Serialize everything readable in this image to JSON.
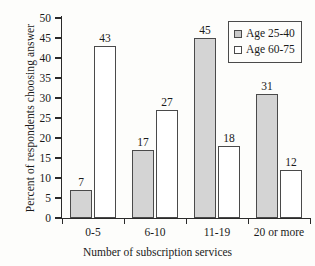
{
  "chart_data": {
    "type": "bar",
    "title": "",
    "xlabel": "Number of subscription services",
    "ylabel": "Percent of respondents choosing answer",
    "categories": [
      "0-5",
      "6-10",
      "11-19",
      "20 or more"
    ],
    "series": [
      {
        "name": "Age 25-40",
        "values": [
          7,
          17,
          45,
          31
        ],
        "color": "#d4d4d4"
      },
      {
        "name": "Age 60-75",
        "values": [
          43,
          27,
          18,
          12
        ],
        "color": "#ffffff"
      }
    ],
    "ylim": [
      0,
      50
    ],
    "ytick_values": [
      0,
      5,
      10,
      15,
      20,
      25,
      30,
      35,
      40,
      45,
      50
    ],
    "ytick_labels": [
      "0",
      "5",
      "10",
      "15",
      "20",
      "25",
      "30",
      "35",
      "40",
      "45",
      "50"
    ],
    "grid": false,
    "legend_position": "top-right",
    "data_labels": [
      "7",
      "43",
      "17",
      "27",
      "45",
      "18",
      "31",
      "12"
    ]
  },
  "legend": {
    "entries": [
      {
        "label": "Age 25-40",
        "swatch": "gray-filled-square"
      },
      {
        "label": "Age 60-75",
        "swatch": "white-filled-square"
      }
    ]
  },
  "colors": {
    "series_1_fill": "#d4d4d4",
    "series_2_fill": "#ffffff",
    "bar_stroke": "#4a4a4a",
    "axis": "#2a2a2a",
    "text": "#1a1a1a",
    "background": "#fdfdfb"
  }
}
